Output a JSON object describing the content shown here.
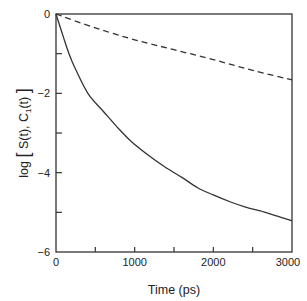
{
  "chart_data": {
    "type": "line",
    "title": "",
    "xlabel": "Time (ps)",
    "ylabel": "log [S(t), C1(t)]",
    "ylabel_parts": {
      "prefix": "log",
      "s": "S(t), C",
      "sub": "1",
      "suffix": "(t)"
    },
    "xlim": [
      0,
      3000
    ],
    "ylim": [
      -6,
      0
    ],
    "x_ticks": [
      0,
      500,
      1000,
      1500,
      2000,
      2500,
      3000
    ],
    "x_tick_labels": [
      {
        "value": 0,
        "label": "0"
      },
      {
        "value": 1000,
        "label": "1000"
      },
      {
        "value": 2000,
        "label": "2000"
      },
      {
        "value": 3000,
        "label": "3000"
      }
    ],
    "y_ticks": [
      0,
      -1,
      -2,
      -3,
      -4,
      -5,
      -6
    ],
    "y_tick_labels": [
      {
        "value": 0,
        "label": "0"
      },
      {
        "value": -2,
        "label": "-2"
      },
      {
        "value": -4,
        "label": "-4"
      },
      {
        "value": -6,
        "label": "-6"
      }
    ],
    "grid": false,
    "legend": null,
    "series": [
      {
        "name": "S(t)",
        "style": "solid",
        "x": [
          0,
          100,
          165,
          250,
          405,
          600,
          800,
          960,
          1200,
          1380,
          1600,
          1800,
          2000,
          2220,
          2400,
          2640,
          2800,
          3000
        ],
        "values": [
          0,
          -0.62,
          -1.0,
          -1.4,
          -2.0,
          -2.45,
          -2.9,
          -3.22,
          -3.6,
          -3.85,
          -4.12,
          -4.38,
          -4.56,
          -4.74,
          -4.86,
          -4.99,
          -5.09,
          -5.21
        ]
      },
      {
        "name": "C1(t)",
        "style": "dashed",
        "x": [
          0,
          500,
          1000,
          1500,
          2000,
          2500,
          3000
        ],
        "values": [
          0,
          -0.35,
          -0.65,
          -0.9,
          -1.15,
          -1.42,
          -1.66
        ]
      }
    ]
  }
}
